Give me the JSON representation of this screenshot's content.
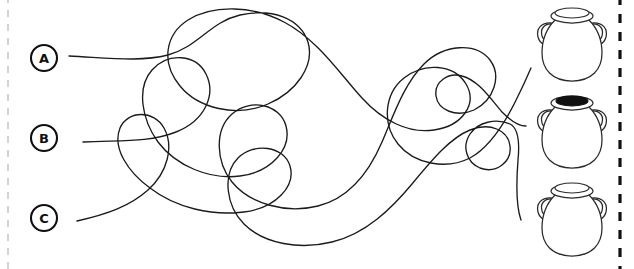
{
  "page": {
    "background_color": "#ffffff",
    "ink_color": "#1b1b1b",
    "width": 634,
    "height": 269
  },
  "labels": [
    {
      "id": "A",
      "letter": "A",
      "cx": 44,
      "cy": 58,
      "r": 13
    },
    {
      "id": "B",
      "letter": "B",
      "cx": 44,
      "cy": 138,
      "r": 13
    },
    {
      "id": "C",
      "letter": "C",
      "cx": 44,
      "cy": 218,
      "r": 13
    }
  ],
  "vases": [
    {
      "id": "vase-top",
      "index": 1,
      "opening": "empty",
      "opening_color": "#ffffff",
      "cx": 572,
      "cy": 43
    },
    {
      "id": "vase-middle",
      "index": 2,
      "opening": "filled",
      "opening_color": "#111111",
      "cx": 572,
      "cy": 130
    },
    {
      "id": "vase-bottom",
      "index": 3,
      "opening": "empty",
      "opening_color": "#ffffff",
      "cx": 572,
      "cy": 218
    }
  ],
  "borders": {
    "right_dashed": {
      "visible": true,
      "color": "#111111",
      "x": 620
    },
    "left_dashed": {
      "visible": true,
      "color": "#c9c9c9",
      "x": 8
    }
  },
  "tangle": {
    "stroke_color": "#1b1b1b",
    "stroke_width": 1.35,
    "line_count": 3,
    "paths": [
      {
        "id": "path-A",
        "from": "A",
        "start": [
          69,
          56
        ],
        "end": [
          531,
          68
        ],
        "d": "M69,56 C110,58 140,62 168,55 C198,47 210,22 240,15 C272,8 300,18 308,42 C315,66 296,92 268,104 C236,118 198,108 180,86 C160,62 166,34 188,20 C214,4 254,6 284,22 C318,40 340,74 362,98 C382,120 408,134 434,130 C462,126 478,104 466,84 C454,64 424,62 404,78 C384,94 382,124 398,144 C414,164 446,170 470,158 C492,146 508,118 520,92 C526,80 529,72 531,68"
      },
      {
        "id": "path-B",
        "from": "B",
        "start": [
          83,
          142
        ],
        "end": [
          526,
          126
        ],
        "d": "M83,142 C120,140 148,143 176,132 C206,120 216,94 206,74 C196,54 168,52 152,70 C136,88 142,120 158,142 C176,166 210,180 240,176 C272,172 292,148 286,126 C280,104 250,98 232,114 C214,130 216,162 232,182 C250,204 286,214 318,206 C350,198 370,170 382,142 C394,114 404,84 424,64 C444,44 476,42 490,60 C502,76 494,100 474,110 C456,118 438,110 436,96 C434,82 448,72 462,76 C478,80 490,98 502,112 C512,122 520,126 526,126"
      },
      {
        "id": "path-C",
        "from": "C",
        "start": [
          77,
          221
        ],
        "end": [
          521,
          220
        ],
        "d": "M77,221 C108,214 130,206 148,190 C168,172 174,146 164,128 C154,110 128,110 120,128 C112,148 128,172 150,188 C176,208 212,216 244,212 C276,208 296,186 290,166 C284,146 254,142 238,158 C222,174 226,206 244,224 C264,244 300,250 332,242 C366,234 392,208 412,184 C432,160 450,138 470,130 C490,122 508,130 510,146 C512,162 496,174 480,168 C466,162 462,146 470,134 C478,122 496,118 510,124 C518,128 520,140 518,160 C516,186 516,206 521,220"
      }
    ]
  }
}
